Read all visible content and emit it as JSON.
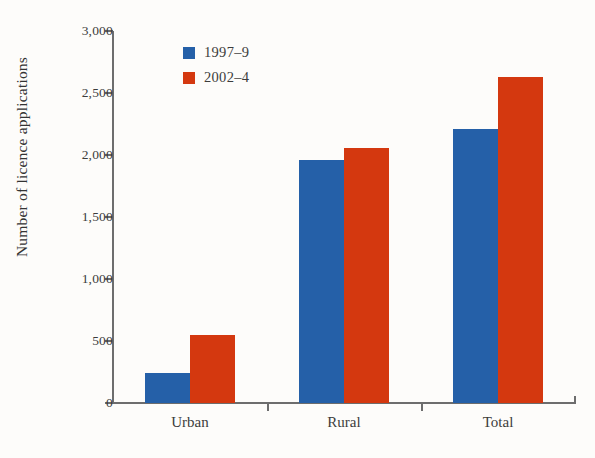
{
  "chart_data": {
    "type": "bar",
    "title": "",
    "xlabel": "",
    "ylabel": "Number of licence applications",
    "categories": [
      "Urban",
      "Rural",
      "Total"
    ],
    "series": [
      {
        "name": "1997–9",
        "color": "#2560a8",
        "values": [
          240,
          1960,
          2210
        ]
      },
      {
        "name": "2002–4",
        "color": "#d4380f",
        "values": [
          550,
          2060,
          2630
        ]
      }
    ],
    "ylim": [
      0,
      3000
    ],
    "ytick_values": [
      0,
      500,
      1000,
      1500,
      2000,
      2500,
      3000
    ],
    "ytick_labels": [
      "0",
      "500",
      "1,000",
      "1,500",
      "2,000",
      "2,500",
      "3,000"
    ],
    "grid": false,
    "legend_position": "top-left-inside"
  },
  "legend": {
    "entries": [
      {
        "label": "1997–9",
        "color": "#2560a8"
      },
      {
        "label": "2002–4",
        "color": "#d4380f"
      }
    ]
  },
  "axes": {
    "y_title": "Number of licence applications",
    "y_labels": [
      "3,000",
      "2,500",
      "2,000",
      "1,500",
      "1,000",
      "500",
      "0"
    ],
    "x_labels": [
      "Urban",
      "Rural",
      "Total"
    ]
  },
  "colors": {
    "series_1997_9": "#2560a8",
    "series_2002_4": "#d4380f",
    "axis": "#6d6d6d",
    "text": "#3c3c3c",
    "background": "#fdfcfa"
  }
}
